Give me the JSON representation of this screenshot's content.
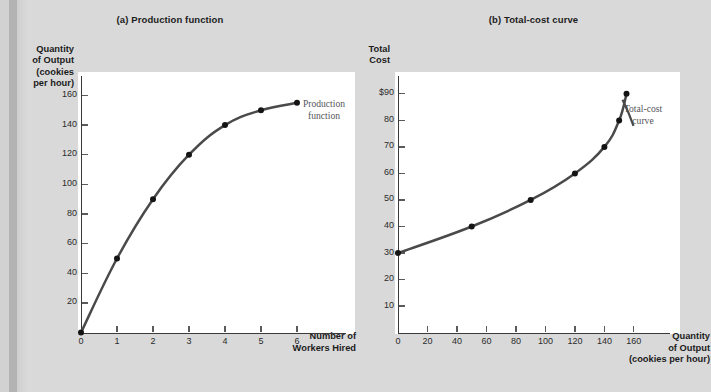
{
  "figure": {
    "panel_a": {
      "title": "(a) Production function",
      "y_axis_title": "Quantity\nof Output\n(cookies\nper hour)",
      "y_axis_title_lines": [
        "Quantity",
        "of Output",
        "(cookies",
        "per hour)"
      ],
      "x_axis_title_lines": [
        "Number of",
        "Workers Hired"
      ],
      "annotation_lines": [
        "Production",
        "function"
      ],
      "y_ticks": [
        "160",
        "140",
        "120",
        "100",
        "80",
        "60",
        "40",
        "20"
      ],
      "x_ticks": [
        "0",
        "1",
        "2",
        "3",
        "4",
        "5",
        "6"
      ]
    },
    "panel_b": {
      "title": "(b) Total-cost curve",
      "y_axis_title_lines": [
        "Total",
        "Cost"
      ],
      "x_axis_title_lines": [
        "Quantity",
        "of Output",
        "(cookies per hour)"
      ],
      "annotation_lines": [
        "Total-cost",
        "curve"
      ],
      "y_ticks": [
        "$90",
        "80",
        "70",
        "60",
        "50",
        "40",
        "30",
        "20",
        "10"
      ],
      "x_ticks": [
        "0",
        "20",
        "40",
        "60",
        "80",
        "100",
        "120",
        "140",
        "160"
      ]
    },
    "colors": {
      "page_background": "#d9d9d9",
      "plot_background": "#ffffff",
      "curve": "#4a4a4a",
      "point": "#141414",
      "axis": "#3a3a3a",
      "annotation_text": "#55555a",
      "title_text": "#1c1c1c"
    }
  },
  "chart_data": [
    {
      "type": "line",
      "panel": "(a)",
      "title": "(a) Production function",
      "xlabel": "Number of Workers Hired",
      "ylabel": "Quantity of Output (cookies per hour)",
      "series": [
        {
          "name": "Production function",
          "x": [
            0,
            1,
            2,
            3,
            4,
            5,
            6
          ],
          "values": [
            0,
            50,
            90,
            120,
            140,
            150,
            155
          ]
        }
      ],
      "xlim": [
        0,
        7
      ],
      "ylim": [
        0,
        170
      ],
      "xticks": [
        0,
        1,
        2,
        3,
        4,
        5,
        6
      ],
      "yticks": [
        20,
        40,
        60,
        80,
        100,
        120,
        140,
        160
      ],
      "grid": false,
      "markers": true,
      "legend": "inline-annotation",
      "annotations": [
        "Production function"
      ]
    },
    {
      "type": "line",
      "panel": "(b)",
      "title": "(b) Total-cost curve",
      "xlabel": "Quantity of Output (cookies per hour)",
      "ylabel": "Total Cost",
      "series": [
        {
          "name": "Total-cost curve",
          "x": [
            0,
            50,
            90,
            120,
            140,
            150,
            155
          ],
          "values": [
            30,
            40,
            50,
            60,
            70,
            80,
            90
          ]
        }
      ],
      "xlim": [
        0,
        175
      ],
      "ylim": [
        0,
        95
      ],
      "xticks": [
        0,
        20,
        40,
        60,
        80,
        100,
        120,
        140,
        160
      ],
      "yticks": [
        10,
        20,
        30,
        40,
        50,
        60,
        70,
        80,
        90
      ],
      "grid": false,
      "markers": true,
      "legend": "inline-annotation",
      "annotations": [
        "Total-cost curve"
      ]
    }
  ]
}
